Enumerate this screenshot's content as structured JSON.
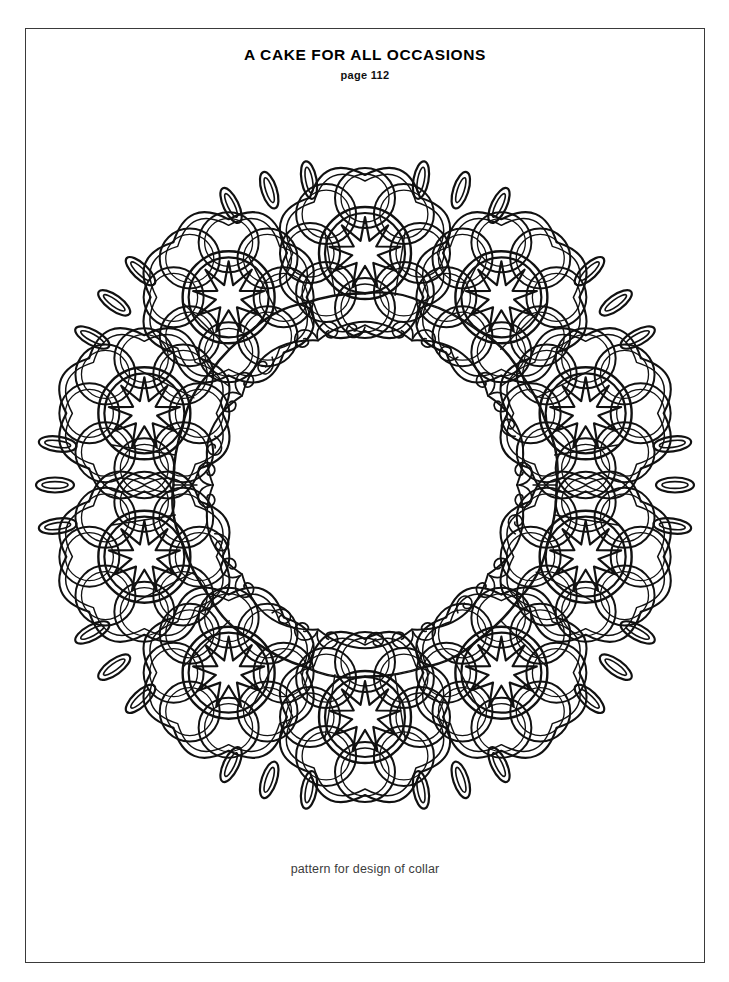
{
  "document": {
    "title": "A CAKE FOR ALL OCCASIONS",
    "page_reference": "page 112",
    "caption": "pattern for design of collar"
  },
  "page": {
    "width": 729,
    "height": 982,
    "background_color": "#ffffff",
    "border_color": "#3a3a3a"
  },
  "artwork": {
    "name": "floral-collar-mandala",
    "type": "line-art-coloring-pattern",
    "ink_color": "#111111",
    "fill_color": "#ffffff",
    "center_x": 340,
    "center_y": 380,
    "outer_radius": 332,
    "petal_flower_count": 10,
    "petal_flower_ring_radius": 232,
    "flower_outer_radius": 92,
    "flower_petal_count": 8,
    "flower_petal_radius": 30,
    "flower_petal_orbit": 55,
    "flower_ring_outer_radius": 46,
    "flower_ring_inner_radius": 40,
    "star_point_count": 9,
    "star_outer_radius": 36,
    "star_inner_radius": 13,
    "inner_opening_radius": 152,
    "inner_scallop_count": 10,
    "scroll_curl_count": 20,
    "chain_link_count": 10,
    "chain_links_per_group": 3,
    "web_ring_radius": 175,
    "web_cell_count": 20
  },
  "chart_data": {
    "type": "scatter",
    "title": "A CAKE FOR ALL OCCASIONS",
    "subtitle": "page 112",
    "annotation": "pattern for design of collar",
    "xlabel": "",
    "ylabel": "",
    "categories": [
      "flower-1",
      "flower-2",
      "flower-3",
      "flower-4",
      "flower-5",
      "flower-6",
      "flower-7",
      "flower-8",
      "flower-9",
      "flower-10"
    ],
    "values": [
      232,
      232,
      232,
      232,
      232,
      232,
      232,
      232,
      232,
      232
    ],
    "angles_deg": [
      270,
      306,
      342,
      18,
      54,
      90,
      126,
      162,
      198,
      234
    ],
    "grid": false,
    "legend_position": "none"
  }
}
